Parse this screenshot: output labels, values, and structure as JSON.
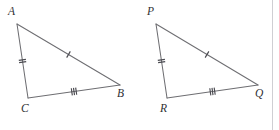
{
  "figure": {
    "background_color": "#ffffff",
    "line_color": "#6e6e72",
    "tick_color": "#4a4a50",
    "label_color": "#2f2f33",
    "border_color": "#cfcfd3",
    "width": 279,
    "height": 130
  },
  "triangles": [
    {
      "name": "triangle-abc",
      "vertices": [
        {
          "label": "A",
          "x": 17,
          "y": 24,
          "label_x": 8,
          "label_y": 6
        },
        {
          "label": "C",
          "x": 28,
          "y": 98,
          "label_x": 21,
          "label_y": 103
        },
        {
          "label": "B",
          "x": 120,
          "y": 85,
          "label_x": 117,
          "label_y": 88
        }
      ],
      "edges": [
        {
          "name": "edge-ab",
          "from": "A",
          "to": "B",
          "ticks": 1
        },
        {
          "name": "edge-ac",
          "from": "A",
          "to": "C",
          "ticks": 2
        },
        {
          "name": "edge-cb",
          "from": "C",
          "to": "B",
          "ticks": 3
        }
      ]
    },
    {
      "name": "triangle-pqr",
      "vertices": [
        {
          "label": "P",
          "x": 156,
          "y": 24,
          "label_x": 147,
          "label_y": 6
        },
        {
          "label": "R",
          "x": 167,
          "y": 98,
          "label_x": 160,
          "label_y": 103
        },
        {
          "label": "Q",
          "x": 258,
          "y": 85,
          "label_x": 255,
          "label_y": 88
        }
      ],
      "edges": [
        {
          "name": "edge-pq",
          "from": "P",
          "to": "Q",
          "ticks": 1
        },
        {
          "name": "edge-pr",
          "from": "P",
          "to": "R",
          "ticks": 2
        },
        {
          "name": "edge-rq",
          "from": "R",
          "to": "Q",
          "ticks": 3
        }
      ]
    }
  ],
  "border": {
    "name": "right-frame-rule",
    "x": 272.5,
    "y1": 0,
    "y2": 130
  }
}
